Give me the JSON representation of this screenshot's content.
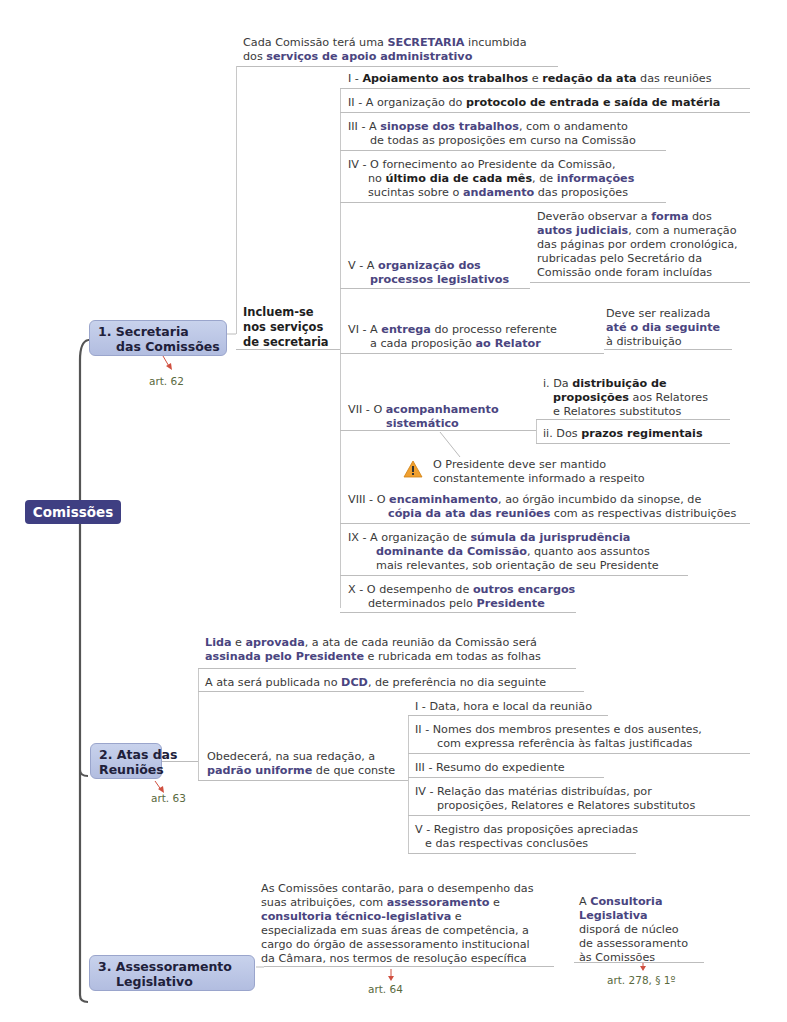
{
  "root": {
    "label": "Comissões",
    "color": "#3f3f82"
  },
  "branches": [
    {
      "label_line1": "1. Secretaria",
      "label_line2": "das Comissões",
      "reference": "art. 62",
      "intro": {
        "line1": [
          "Cada Comissão terá uma ",
          "SECRETARIA",
          " incumbida"
        ],
        "line2": [
          "dos ",
          "serviços de apoio administrativo"
        ]
      },
      "group_label": [
        "Incluem-se",
        "nos serviços",
        "de secretaria"
      ],
      "items": [
        {
          "lines": [
            [
              "I - ",
              "Apoiamento aos trabalhos",
              " e ",
              "redação da ata",
              " das reuniões"
            ]
          ]
        },
        {
          "lines": [
            [
              "II - A organização do ",
              "protocolo de entrada e saída de matéria"
            ]
          ]
        },
        {
          "lines": [
            [
              "III - A ",
              "sinopse dos trabalhos",
              ", com o andamento"
            ],
            [
              "de todas as proposições em curso na Comissão"
            ]
          ]
        },
        {
          "lines": [
            [
              "IV - O fornecimento ao Presidente da Comissão,"
            ],
            [
              "no ",
              "último dia de cada mês",
              ", de ",
              "informações"
            ],
            [
              "sucintas sobre o ",
              "andamento",
              " das proposições"
            ]
          ]
        },
        {
          "lines": [
            [
              "V - A ",
              "organização  dos"
            ],
            [
              "processos legislativos"
            ]
          ],
          "note": [
            [
              "Deverão observar a ",
              "forma",
              " dos"
            ],
            [
              "autos judiciais",
              ", com a numeração"
            ],
            [
              "das páginas por ordem cronológica,"
            ],
            [
              "rubricadas pelo Secretário da"
            ],
            [
              "Comissão onde foram incluídas"
            ]
          ]
        },
        {
          "lines": [
            [
              "VI - A ",
              "entrega",
              " do processo referente"
            ],
            [
              "a cada proposição ",
              "ao Relator"
            ]
          ],
          "note": [
            [
              "Deve ser realizada"
            ],
            [
              "até o dia seguinte"
            ],
            [
              "à distribuição"
            ]
          ]
        },
        {
          "lines": [
            [
              "VII - O ",
              "acompanhamento"
            ],
            [
              "sistemático"
            ]
          ],
          "subitems": [
            [
              [
                "i. Da ",
                "distribuição  de"
              ],
              [
                "proposições",
                " aos  Relatores"
              ],
              [
                "e Relatores substitutos"
              ]
            ],
            [
              [
                "ii. Dos ",
                "prazos regimentais"
              ]
            ]
          ],
          "warning": {
            "icon": "warning-icon",
            "lines": [
              "O Presidente deve ser mantido",
              "constantemente informado a respeito"
            ]
          }
        },
        {
          "lines": [
            [
              "VIII - O ",
              "encaminhamento",
              ", ao órgão incumbido da sinopse, de"
            ],
            [
              "cópia da ata das reuniões",
              " com as respectivas distribuições"
            ]
          ]
        },
        {
          "lines": [
            [
              "IX - A organização de ",
              "súmula  da  jurisprudência"
            ],
            [
              "dominante da Comissão",
              ", quanto aos assuntos"
            ],
            [
              "mais relevantes, sob orientação de seu Presidente"
            ]
          ]
        },
        {
          "lines": [
            [
              "X - O desempenho de ",
              "outros encargos"
            ],
            [
              "determinados pelo ",
              "Presidente"
            ]
          ]
        }
      ]
    },
    {
      "label_line1": "2. Atas das",
      "label_line2": "Reuniões",
      "reference": "art. 63",
      "statements": [
        [
          [
            "Lida",
            " e ",
            "aprovada",
            ", a ata de cada reunião da Comissão será"
          ],
          [
            "assinada pelo Presidente",
            " e rubricada em todas as folhas"
          ]
        ],
        [
          [
            "A ata será publicada no ",
            "DCD",
            ", de preferência no dia seguinte"
          ]
        ]
      ],
      "group_label": [
        [
          "Obedecerá, na sua redação, a"
        ],
        [
          "padrão uniforme",
          " de que conste"
        ]
      ],
      "items": [
        [
          [
            "I - Data, hora e local da reunião"
          ]
        ],
        [
          [
            "II - Nomes dos membros presentes e dos ausentes,"
          ],
          [
            "com expressa referência às faltas justificadas"
          ]
        ],
        [
          [
            "III - Resumo do expediente"
          ]
        ],
        [
          [
            "IV - Relação das matérias distribuídas, por"
          ],
          [
            "proposições, Relatores e Relatores substitutos"
          ]
        ],
        [
          [
            "V - Registro das proposições apreciadas"
          ],
          [
            "e das respectivas conclusões"
          ]
        ]
      ]
    },
    {
      "label_line1": "3. Assessoramento",
      "label_line2": "Legislativo",
      "text": [
        [
          "As Comissões contarão, para o desempenho das"
        ],
        [
          "suas atribuições, com ",
          "assessoramento",
          " e"
        ],
        [
          "consultoria técnico-legislativa",
          " e"
        ],
        [
          "especializada em suas áreas de competência, a"
        ],
        [
          "cargo do órgão de assessoramento institucional"
        ],
        [
          "da Câmara, nos termos de resolução específica"
        ]
      ],
      "reference": "art. 64",
      "note": [
        [
          "A ",
          "Consultoria"
        ],
        [
          "Legislativa"
        ],
        [
          "disporá de núcleo"
        ],
        [
          "de assessoramento"
        ],
        [
          "às Comissões"
        ]
      ],
      "note_reference": "art. 278, § 1º"
    }
  ],
  "colors": {
    "emphasis": "#4a4580",
    "node_fill": "#b8c3e4",
    "reference_text": "#5a6a40",
    "reference_arrow": "#d05040",
    "warning": "#f0a030"
  }
}
